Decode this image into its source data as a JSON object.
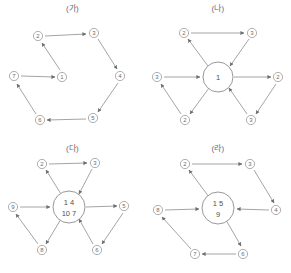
{
  "figure": {
    "panels": [
      {
        "id": "panel-ga",
        "title": "(가)",
        "layout": "cycle",
        "hub": null,
        "nodes": [
          {
            "name": "node-1",
            "label": "1",
            "x": 62,
            "y": 77
          },
          {
            "name": "node-2",
            "label": "2",
            "x": 38,
            "y": 36
          },
          {
            "name": "node-3",
            "label": "3",
            "x": 94,
            "y": 33
          },
          {
            "name": "node-4",
            "label": "4",
            "x": 120,
            "y": 76
          },
          {
            "name": "node-5",
            "label": "5",
            "x": 93,
            "y": 118
          },
          {
            "name": "node-6",
            "label": "6",
            "x": 40,
            "y": 120
          },
          {
            "name": "node-7",
            "label": "7",
            "x": 14,
            "y": 76
          }
        ],
        "edges": [
          {
            "name": "edge-2-to-3",
            "from": "2",
            "to": "3"
          },
          {
            "name": "edge-3-to-4",
            "from": "3",
            "to": "4"
          },
          {
            "name": "edge-4-to-5",
            "from": "4",
            "to": "5"
          },
          {
            "name": "edge-5-to-6",
            "from": "5",
            "to": "6"
          },
          {
            "name": "edge-6-to-7",
            "from": "6",
            "to": "7"
          },
          {
            "name": "edge-7-to-1",
            "from": "7",
            "to": "1"
          },
          {
            "name": "edge-1-to-2",
            "from": "1",
            "to": "2"
          }
        ]
      },
      {
        "id": "panel-na",
        "title": "(나)",
        "layout": "hub",
        "hub": {
          "name": "hub-node",
          "lines": [
            "1"
          ],
          "x": 73,
          "y": 77,
          "r": 15
        },
        "nodes": [
          {
            "name": "node-2-top-left",
            "label": "2",
            "x": 39,
            "y": 33
          },
          {
            "name": "node-3-top-right",
            "label": "3",
            "x": 107,
            "y": 33
          },
          {
            "name": "node-3-left",
            "label": "3",
            "x": 12,
            "y": 77
          },
          {
            "name": "node-2-right",
            "label": "2",
            "x": 133,
            "y": 77
          },
          {
            "name": "node-2-bottom-left",
            "label": "2",
            "x": 40,
            "y": 120
          },
          {
            "name": "node-3-bottom-right",
            "label": "3",
            "x": 106,
            "y": 120
          }
        ],
        "edges": [
          {
            "name": "edge-2-to-3-top",
            "from": "node-2-top-left",
            "to": "node-3-top-right"
          },
          {
            "name": "edge-3top-to-hub",
            "from": "node-3-top-right",
            "to": "hub"
          },
          {
            "name": "edge-hub-to-2top",
            "from": "hub",
            "to": "node-2-top-left"
          },
          {
            "name": "edge-3left-to-hub",
            "from": "node-3-left",
            "to": "hub"
          },
          {
            "name": "edge-hub-to-2right",
            "from": "hub",
            "to": "node-2-right"
          },
          {
            "name": "edge-hub-to-2bottom",
            "from": "hub",
            "to": "node-2-bottom-left"
          },
          {
            "name": "edge-2bottom-to-3left",
            "from": "node-2-bottom-left",
            "to": "node-3-left"
          },
          {
            "name": "edge-3bottom-to-hub",
            "from": "node-3-bottom-right",
            "to": "hub"
          },
          {
            "name": "edge-2right-to-3bottom",
            "from": "node-2-right",
            "to": "node-3-bottom-right"
          }
        ]
      },
      {
        "id": "panel-da",
        "title": "(다)",
        "layout": "hub",
        "hub": {
          "name": "hub-node",
          "lines": [
            "1 4",
            "10 7"
          ],
          "x": 69,
          "y": 67,
          "r": 16
        },
        "nodes": [
          {
            "name": "node-2-top-left",
            "label": "2",
            "x": 42,
            "y": 24
          },
          {
            "name": "node-3-top-right",
            "label": "3",
            "x": 95,
            "y": 23
          },
          {
            "name": "node-9-left",
            "label": "9",
            "x": 13,
            "y": 67
          },
          {
            "name": "node-5-right",
            "label": "5",
            "x": 124,
            "y": 66
          },
          {
            "name": "node-8-bottom-left",
            "label": "8",
            "x": 42,
            "y": 110
          },
          {
            "name": "node-6-bottom-right",
            "label": "6",
            "x": 97,
            "y": 110
          }
        ],
        "edges": [
          {
            "name": "edge-2-to-3-top",
            "from": "node-2-top-left",
            "to": "node-3-top-right"
          },
          {
            "name": "edge-3top-to-hub",
            "from": "node-3-top-right",
            "to": "hub"
          },
          {
            "name": "edge-hub-to-2top",
            "from": "hub",
            "to": "node-2-top-left"
          },
          {
            "name": "edge-9left-to-hub",
            "from": "node-9-left",
            "to": "hub"
          },
          {
            "name": "edge-hub-to-5right",
            "from": "hub",
            "to": "node-5-right"
          },
          {
            "name": "edge-hub-to-8bottom",
            "from": "hub",
            "to": "node-8-bottom-left"
          },
          {
            "name": "edge-8bottom-to-9left",
            "from": "node-8-bottom-left",
            "to": "node-9-left"
          },
          {
            "name": "edge-6bottom-to-hub",
            "from": "node-6-bottom-right",
            "to": "hub"
          },
          {
            "name": "edge-5right-to-6bottom",
            "from": "node-5-right",
            "to": "node-6-bottom-right"
          }
        ]
      },
      {
        "id": "panel-ra",
        "title": "(라)",
        "layout": "hub",
        "hub": {
          "name": "hub-node",
          "lines": [
            "1 5",
            "9"
          ],
          "x": 73,
          "y": 68,
          "r": 16
        },
        "nodes": [
          {
            "name": "node-2-top-left",
            "label": "2",
            "x": 40,
            "y": 24
          },
          {
            "name": "node-3-top-right",
            "label": "3",
            "x": 105,
            "y": 24
          },
          {
            "name": "node-8-left",
            "label": "8",
            "x": 13,
            "y": 70
          },
          {
            "name": "node-4-right",
            "label": "4",
            "x": 131,
            "y": 70
          },
          {
            "name": "node-7-bottom-left",
            "label": "7",
            "x": 50,
            "y": 114
          },
          {
            "name": "node-6-bottom-right",
            "label": "6",
            "x": 98,
            "y": 114
          }
        ],
        "edges": [
          {
            "name": "edge-2-to-3-top",
            "from": "node-2-top-left",
            "to": "node-3-top-right"
          },
          {
            "name": "edge-3top-to-4right",
            "from": "node-3-top-right",
            "to": "node-4-right"
          },
          {
            "name": "edge-hub-to-2top",
            "from": "hub",
            "to": "node-2-top-left"
          },
          {
            "name": "edge-8left-to-hub",
            "from": "node-8-left",
            "to": "hub"
          },
          {
            "name": "edge-4right-to-hub",
            "from": "node-4-right",
            "to": "hub"
          },
          {
            "name": "edge-hub-to-6bottom",
            "from": "hub",
            "to": "node-6-bottom-right"
          },
          {
            "name": "edge-6bottom-to-7bottom",
            "from": "node-6-bottom-right",
            "to": "node-7-bottom-left"
          },
          {
            "name": "edge-7bottom-to-8left",
            "from": "node-7-bottom-left",
            "to": "node-8-left"
          }
        ]
      }
    ]
  }
}
